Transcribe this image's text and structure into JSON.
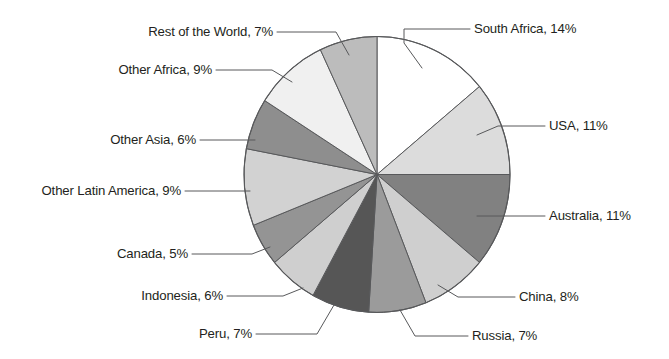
{
  "chart_data": {
    "type": "pie",
    "title": "",
    "subtitle": "",
    "xlabel": "",
    "ylabel": "",
    "legend_position": "none",
    "grid": false,
    "unit": "%",
    "start_angle_deg": 0,
    "direction": "clockwise",
    "categories": [
      "South Africa",
      "USA",
      "Australia",
      "China",
      "Russia",
      "Peru",
      "Indonesia",
      "Canada",
      "Other Latin America",
      "Other Asia",
      "Other Africa",
      "Rest of the World"
    ],
    "values": [
      14,
      11,
      11,
      8,
      7,
      7,
      6,
      5,
      9,
      6,
      9,
      7
    ],
    "slices": [
      {
        "label": "South Africa",
        "value": 14,
        "label_text": "South Africa, 14%",
        "color": "#ffffff",
        "label_side": "right"
      },
      {
        "label": "USA",
        "value": 11,
        "label_text": "USA, 11%",
        "color": "#dcdcdc",
        "label_side": "right"
      },
      {
        "label": "Australia",
        "value": 11,
        "label_text": "Australia, 11%",
        "color": "#818181",
        "label_side": "right"
      },
      {
        "label": "China",
        "value": 8,
        "label_text": "China, 8%",
        "color": "#cfcfcf",
        "label_side": "right"
      },
      {
        "label": "Russia",
        "value": 7,
        "label_text": "Russia, 7%",
        "color": "#9b9b9b",
        "label_side": "right"
      },
      {
        "label": "Peru",
        "value": 7,
        "label_text": "Peru, 7%",
        "color": "#565656",
        "label_side": "left"
      },
      {
        "label": "Indonesia",
        "value": 6,
        "label_text": "Indonesia, 6%",
        "color": "#cfcfcf",
        "label_side": "left"
      },
      {
        "label": "Canada",
        "value": 5,
        "label_text": "Canada, 5%",
        "color": "#949494",
        "label_side": "left"
      },
      {
        "label": "Other Latin America",
        "value": 9,
        "label_text": "Other Latin America, 9%",
        "color": "#d2d2d2",
        "label_side": "left"
      },
      {
        "label": "Other Asia",
        "value": 6,
        "label_text": "Other Asia, 6%",
        "color": "#8e8e8e",
        "label_side": "left"
      },
      {
        "label": "Other Africa",
        "value": 9,
        "label_text": "Other Africa, 9%",
        "color": "#f0f0f0",
        "label_side": "left"
      },
      {
        "label": "Rest of the World",
        "value": 7,
        "label_text": "Rest of the World, 7%",
        "color": "#bcbcbc",
        "label_side": "left"
      }
    ]
  }
}
